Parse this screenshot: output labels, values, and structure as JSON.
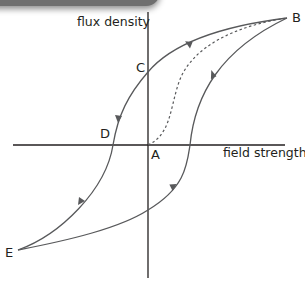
{
  "diagram": {
    "type": "hysteresis-loop",
    "y_axis_label": "flux density",
    "x_axis_label": "field strength",
    "points": {
      "A": "A",
      "B": "B",
      "C": "C",
      "D": "D",
      "E": "E"
    },
    "curves": [
      {
        "name": "initial-magnetization",
        "from": "A",
        "to": "B",
        "style": "dashed"
      },
      {
        "name": "upper-branch",
        "from": "B",
        "to": "E",
        "via": [
          "C",
          "D"
        ],
        "style": "solid"
      },
      {
        "name": "lower-branch",
        "from": "E",
        "to": "B",
        "style": "solid"
      }
    ],
    "colors": {
      "axis": "#231f20",
      "curve": "#58595b",
      "text": "#231f20"
    }
  }
}
